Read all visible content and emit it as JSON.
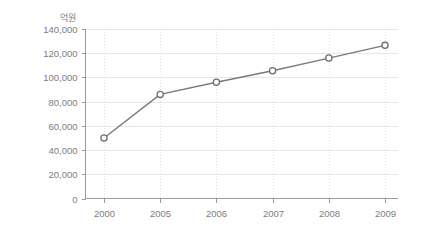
{
  "chart_data": {
    "type": "line",
    "title": "",
    "subtitle": "",
    "xlabel": "",
    "ylabel": "",
    "unit_label": "억원",
    "categories": [
      "2000",
      "2005",
      "2006",
      "2007",
      "2008",
      "2009"
    ],
    "values": [
      50000,
      86000,
      96000,
      105500,
      116000,
      126500
    ],
    "series": [
      {
        "name": "",
        "values": [
          50000,
          86000,
          96000,
          105500,
          116000,
          126500
        ]
      }
    ],
    "ylim": [
      0,
      140000
    ],
    "ytick_values": [
      0,
      20000,
      40000,
      60000,
      80000,
      100000,
      120000,
      140000
    ],
    "ytick_labels": [
      "0",
      "20,000",
      "40,000",
      "60,000",
      "80,000",
      "100,000",
      "120,000",
      "140,000"
    ],
    "xtick_labels": [
      "2000",
      "2005",
      "2006",
      "2007",
      "2008",
      "2009"
    ],
    "grid": {
      "horizontal": true,
      "vertical": true
    },
    "legend": {
      "visible": false,
      "position": "none"
    },
    "marker_style": "open-circle",
    "colors": {
      "line": "#7a7a7a",
      "marker_fill": "#ffffff",
      "marker_stroke": "#6f6f6f",
      "gridline": "#e6e6e6",
      "gridline_vertical": "#e2e2e2",
      "axis": "#9a9a9a",
      "text": "#7d7d7d",
      "background": "#ffffff"
    }
  }
}
